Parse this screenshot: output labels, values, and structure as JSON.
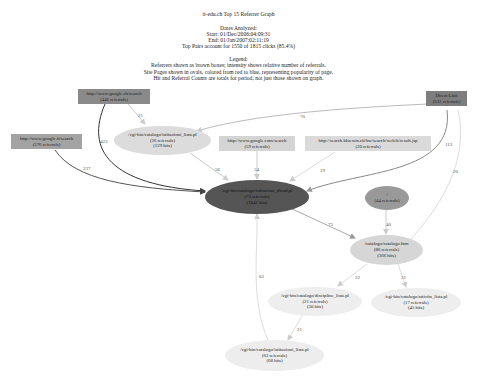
{
  "header": {
    "title": "ti-edu.ch Top 15 Referrer Graph",
    "dates_label": "Dates Analyzed:",
    "start": "Start: 01/Dec/2006:04:09:31",
    "end": "End: 01/Jan/2007:02:11:19",
    "top_pairs": "Top Pairs account for 1550 of 1815 clicks (85.4%)"
  },
  "legend": {
    "title": "Legend:",
    "line1": "Referrers shown as brown boxes; intensity shows relative number of referrals.",
    "line2": "Site Pages shown in ovals, colored from red to blue, representing popularity of page.",
    "line3": "Hit and Referral Counts are totals for period, not just those shown on graph."
  },
  "referrers": [
    {
      "id": "google_ch",
      "url": "http://www.google.ch/search",
      "count": "(446 referrals)",
      "color": "#8a8a8a"
    },
    {
      "id": "direct",
      "url": "Direct Link",
      "count": "(531 referrals)",
      "color": "#7d7d7d"
    },
    {
      "id": "google_it",
      "url": "http://www.google.it/search",
      "count": "(276 referrals)",
      "color": "#a3a3a3"
    },
    {
      "id": "google_com",
      "url": "http://www.google.com/search",
      "count": "(59 referrals)",
      "color": "#d4d4d4"
    },
    {
      "id": "bluewin",
      "url": "http://search.bluewin.ch/bw/search/web/it/result.jsp",
      "count": "(20 referrals)",
      "color": "#dadada"
    }
  ],
  "pages": [
    {
      "id": "istituzioni_lista",
      "url": "/cgi-bin/catalogo/istituzioni_lista.pl",
      "refs": "(36 referrals)",
      "hits": "(129 hits)",
      "color": "#dcdcdc"
    },
    {
      "id": "istituzioni_dicad",
      "url": "/cgi-bin/catalogo/istituzioni_dicad.pl",
      "refs": "(73 referrals)",
      "hits": "(1042 hits)",
      "color": "#555555"
    },
    {
      "id": "root",
      "url": "/",
      "refs": "(44 referrals)",
      "hits": "",
      "color": "#999999"
    },
    {
      "id": "catalogo",
      "url": "/catalogo/catalogo.htm",
      "refs": "(86 referrals)",
      "hits": "(366 hits)",
      "color": "#d6d6d6"
    },
    {
      "id": "discipline",
      "url": "/cgi-bin/catalogo/discipline_lista.pl",
      "refs": "(21 referrals)",
      "hits": "(30 hits)",
      "color": "#eeeeee"
    },
    {
      "id": "attivita",
      "url": "/cgi-bin/catalogo/attivita_lista.pl",
      "refs": "(17 referrals)",
      "hits": "(45 hits)",
      "color": "#eeeeee"
    },
    {
      "id": "istituzioni_lista2",
      "url": "/cgi-bin/catalogo/istituzioni_lista.pl",
      "refs": "(62 referrals)",
      "hits": "(68 hits)",
      "color": "#ededed"
    }
  ],
  "edges": [
    {
      "from": "google_ch",
      "to": "istituzioni_lista",
      "label": "21"
    },
    {
      "from": "google_ch",
      "to": "istituzioni_dicad",
      "label": "423"
    },
    {
      "from": "direct",
      "to": "istituzioni_lista",
      "label": "70"
    },
    {
      "from": "direct",
      "to": "istituzioni_dicad",
      "label": "113"
    },
    {
      "from": "direct",
      "to": "catalogo",
      "label": "20"
    },
    {
      "from": "google_it",
      "to": "istituzioni_dicad",
      "label": "237"
    },
    {
      "from": "istituzioni_lista",
      "to": "istituzioni_dicad",
      "label": "56"
    },
    {
      "from": "google_com",
      "to": "istituzioni_dicad",
      "label": "54"
    },
    {
      "from": "bluewin",
      "to": "istituzioni_dicad",
      "label": "19"
    },
    {
      "from": "istituzioni_dicad",
      "to": "catalogo",
      "label": "73"
    },
    {
      "from": "root",
      "to": "catalogo",
      "label": "40"
    },
    {
      "from": "catalogo",
      "to": "discipline",
      "label": "22"
    },
    {
      "from": "catalogo",
      "to": "attivita",
      "label": "31"
    },
    {
      "from": "discipline",
      "to": "istituzioni_lista2",
      "label": "21"
    },
    {
      "from": "istituzioni_lista2",
      "to": "istituzioni_dicad",
      "label": "62"
    }
  ]
}
